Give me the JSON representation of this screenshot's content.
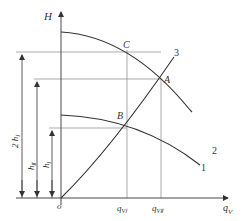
{
  "diagram": {
    "type": "pump-curves",
    "axes": {
      "y_label": "H",
      "x_label": "q",
      "x_label_sub": "V",
      "origin_label": "o"
    },
    "curves": [
      {
        "id": "1",
        "label": "1",
        "description": "single pump curve"
      },
      {
        "id": "2",
        "label": "2",
        "description": "two pumps in series curve"
      },
      {
        "id": "3",
        "label": "3",
        "description": "pipeline characteristic curve"
      }
    ],
    "points": [
      {
        "label": "A"
      },
      {
        "label": "B"
      },
      {
        "label": "C"
      }
    ],
    "x_ticks": [
      {
        "main": "q",
        "sub": "VⅠ"
      },
      {
        "main": "q",
        "sub": "VⅡ"
      }
    ],
    "dimension_labels": [
      {
        "main": "2 h",
        "sub": "Ⅰ"
      },
      {
        "main": "h",
        "sub": "Ⅱ"
      },
      {
        "main": "h",
        "sub": "Ⅰ"
      }
    ],
    "colors": {
      "line": "#333333",
      "guide": "#777777",
      "background": "#ffffff"
    }
  }
}
